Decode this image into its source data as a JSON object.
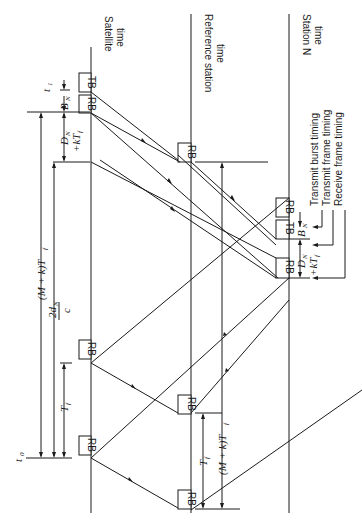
{
  "figure": {
    "orientation": "rotated-90-ccw",
    "axes": {
      "satellite": {
        "label_line1": "Satellite",
        "label_line2": "time"
      },
      "reference": {
        "label_line1": "Reference station",
        "label_line2": "time"
      },
      "station_n": {
        "label_line1": "Station N",
        "label_line2": "time"
      }
    },
    "boxes": {
      "rb": "RB",
      "tb": "TB"
    },
    "legend": {
      "transmit_burst": "Transmit burst timing",
      "transmit_frame": "Transmit frame timing",
      "receive_frame": "Receive frame timing"
    },
    "annotations": {
      "t0": "t",
      "t0_sub": "0",
      "t1": "t",
      "t1_sub": "1",
      "bn": "B",
      "bn_sub": "N",
      "dn": "D",
      "dn_sub": "N",
      "kt": "+kT",
      "kt_sub": "f",
      "tf": "T",
      "tf_sub": "f",
      "mk_tf": "(M + k)T",
      "mk_tf_sub": "f",
      "two_d": "2d",
      "two_d_sub": "N",
      "c": "c"
    }
  }
}
